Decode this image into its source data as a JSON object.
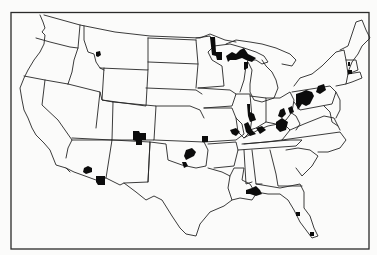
{
  "map": {
    "title": "",
    "region": "Contiguous United States",
    "style": "black-and-white outline map with state boundaries",
    "colors": {
      "background": "#fbfbfa",
      "boundary": "#262626",
      "marked_area": "#0c0c0c"
    },
    "marked_areas": [
      {
        "state": "Montana",
        "location": "west-central"
      },
      {
        "state": "Minnesota",
        "location": "northeast (Arrowhead / Iron Range)"
      },
      {
        "state": "Wisconsin",
        "location": "north along Lake Superior"
      },
      {
        "state": "Michigan",
        "location": "Upper Peninsula"
      },
      {
        "state": "Illinois",
        "location": "central and southern"
      },
      {
        "state": "Indiana",
        "location": "southwest"
      },
      {
        "state": "Kentucky",
        "location": "west and east"
      },
      {
        "state": "Ohio",
        "location": "east and southeast"
      },
      {
        "state": "Pennsylvania",
        "location": "west and east"
      },
      {
        "state": "West Virginia",
        "location": "north"
      },
      {
        "state": "Colorado",
        "location": "southwest / Four Corners area"
      },
      {
        "state": "Arizona",
        "location": "southeast"
      },
      {
        "state": "Oklahoma",
        "location": "central"
      },
      {
        "state": "Missouri",
        "location": "west"
      },
      {
        "state": "Alabama",
        "location": "south (Mobile area)"
      },
      {
        "state": "Florida",
        "location": "central and south"
      },
      {
        "state": "Connecticut",
        "location": "small area"
      }
    ]
  }
}
